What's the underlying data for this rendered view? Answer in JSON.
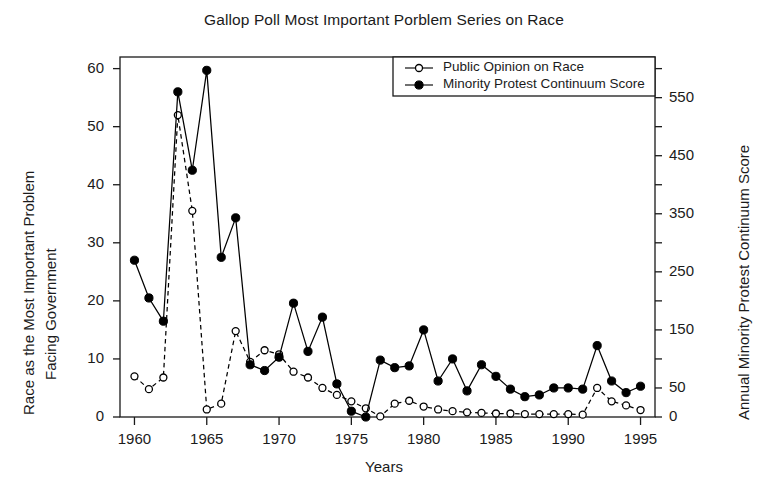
{
  "chart_data": {
    "type": "line",
    "title": "Gallop Poll Most Important Porblem Series on Race",
    "xlabel": "Years",
    "ylabel": "Race as the Most Important Problem Facing Government",
    "ylabel_line1": "Race as the Most Important Problem",
    "ylabel_line2": "Facing Government",
    "y2label": "Annual Minority Protest Continuum Score",
    "grid": false,
    "legend_position": "top-right",
    "xlim": [
      1959,
      1996
    ],
    "ylim": [
      0,
      62
    ],
    "y2lim": [
      0,
      620
    ],
    "xticks": [
      1960,
      1965,
      1970,
      1975,
      1980,
      1985,
      1990,
      1995
    ],
    "xtick_labels": [
      "1960",
      "1965",
      "1970",
      "1975",
      "1980",
      "1985",
      "1990",
      "1995"
    ],
    "yticks": [
      0,
      10,
      20,
      30,
      40,
      50,
      60
    ],
    "ytick_labels": [
      "0",
      "10",
      "20",
      "30",
      "40",
      "50",
      "60"
    ],
    "y2ticks": [
      0,
      50,
      100,
      150,
      200,
      250,
      300,
      350,
      400,
      450,
      500,
      550,
      600
    ],
    "y2tick_labels": [
      "0",
      "50",
      "",
      "150",
      "",
      "250",
      "",
      "350",
      "",
      "450",
      "",
      "550",
      ""
    ],
    "x": [
      1960,
      1961,
      1962,
      1963,
      1964,
      1965,
      1966,
      1967,
      1968,
      1969,
      1970,
      1971,
      1972,
      1973,
      1974,
      1975,
      1976,
      1977,
      1978,
      1979,
      1980,
      1981,
      1982,
      1983,
      1984,
      1985,
      1986,
      1987,
      1988,
      1989,
      1990,
      1991,
      1992,
      1993,
      1994,
      1995
    ],
    "series": [
      {
        "name": "Public Opinion on Race",
        "axis": "left",
        "marker": "open-circle",
        "linestyle": "dashed",
        "color": "#000000",
        "values": [
          7.0,
          4.8,
          6.8,
          52.0,
          35.5,
          1.3,
          2.3,
          14.8,
          9.5,
          11.5,
          10.8,
          7.8,
          6.8,
          5.0,
          3.8,
          2.7,
          1.5,
          0.1,
          2.3,
          2.8,
          1.8,
          1.3,
          1.0,
          0.8,
          0.7,
          0.6,
          0.6,
          0.5,
          0.5,
          0.5,
          0.5,
          0.4,
          5.0,
          2.7,
          2.0,
          1.2
        ]
      },
      {
        "name": "Minority Protest Continuum Score",
        "axis": "right",
        "marker": "filled-circle",
        "linestyle": "solid",
        "color": "#000000",
        "values": [
          270,
          205,
          165,
          560,
          425,
          597,
          275,
          343,
          90,
          80,
          103,
          196,
          113,
          172,
          57,
          10,
          0,
          98,
          85,
          88,
          150,
          62,
          100,
          45,
          90,
          70,
          48,
          35,
          38,
          50,
          50,
          48,
          123,
          62,
          42,
          53
        ],
        "values_left_scale": [
          27.0,
          20.5,
          16.5,
          56.0,
          42.5,
          59.7,
          27.5,
          34.3,
          9.0,
          8.0,
          10.3,
          19.6,
          11.3,
          17.2,
          5.7,
          1.0,
          0.0,
          9.8,
          8.5,
          8.8,
          15.0,
          6.2,
          10.0,
          4.5,
          9.0,
          7.0,
          4.8,
          3.5,
          3.8,
          5.0,
          5.0,
          4.8,
          12.3,
          6.2,
          4.2,
          5.3
        ]
      }
    ]
  },
  "legend": {
    "entries": [
      {
        "label": "Public Opinion on Race",
        "marker": "open-circle"
      },
      {
        "label": "Minority Protest Continuum Score",
        "marker": "filled-circle"
      }
    ]
  }
}
